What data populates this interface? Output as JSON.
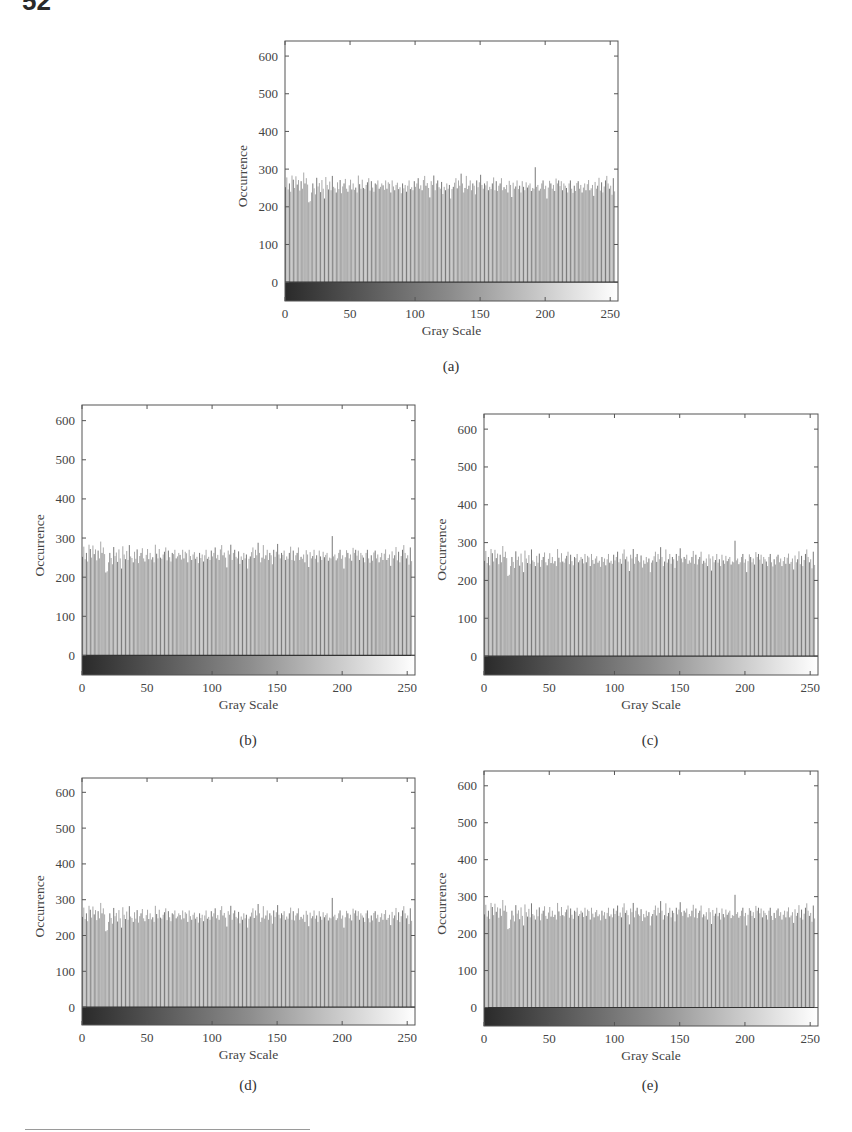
{
  "page": {
    "number": "52"
  },
  "chart_data": [
    {
      "id": "a",
      "type": "bar",
      "caption": "(a)",
      "title": "",
      "xlabel": "Gray Scale",
      "ylabel": "Occurrence",
      "xlim": [
        0,
        255
      ],
      "ylim": [
        -50,
        640
      ],
      "xticks": [
        0,
        50,
        100,
        150,
        200,
        250
      ],
      "yticks": [
        0,
        100,
        200,
        300,
        400,
        500,
        600
      ],
      "grid": false,
      "legend": null,
      "colorbar": "grayscale gradient black to white below zero line",
      "description": "Near-uniform histogram; 256 bins each roughly 210–290, mean ≈ 250, one spike ≈ 305 near gray level 197",
      "values_summary": {
        "min": 210,
        "max": 305,
        "mean": 250
      }
    },
    {
      "id": "b",
      "type": "bar",
      "caption": "(b)",
      "xlabel": "Gray Scale",
      "ylabel": "Occurrence",
      "xlim": [
        0,
        255
      ],
      "ylim": [
        -50,
        640
      ],
      "xticks": [
        0,
        50,
        100,
        150,
        200,
        250
      ],
      "yticks": [
        0,
        100,
        200,
        300,
        400,
        500,
        600
      ],
      "grid": false,
      "legend": null,
      "description": "Near-uniform histogram; bins roughly 210–290, spike ≈ 305 near gray level 197",
      "values_summary": {
        "min": 210,
        "max": 305,
        "mean": 250
      }
    },
    {
      "id": "c",
      "type": "bar",
      "caption": "(c)",
      "xlabel": "Gray Scale",
      "ylabel": "Occurrence",
      "xlim": [
        0,
        255
      ],
      "ylim": [
        -50,
        640
      ],
      "xticks": [
        0,
        50,
        100,
        150,
        200,
        250
      ],
      "yticks": [
        0,
        100,
        200,
        300,
        400,
        500,
        600
      ],
      "grid": false,
      "legend": null,
      "description": "Near-uniform histogram; bins roughly 210–290, spike ≈ 305 near gray level 197",
      "values_summary": {
        "min": 210,
        "max": 305,
        "mean": 250
      }
    },
    {
      "id": "d",
      "type": "bar",
      "caption": "(d)",
      "xlabel": "Gray Scale",
      "ylabel": "Occurrence",
      "xlim": [
        0,
        255
      ],
      "ylim": [
        -50,
        640
      ],
      "xticks": [
        0,
        50,
        100,
        150,
        200,
        250
      ],
      "yticks": [
        0,
        100,
        200,
        300,
        400,
        500,
        600
      ],
      "grid": false,
      "legend": null,
      "description": "Near-uniform histogram; bins roughly 210–290, spike ≈ 305 near gray level 197",
      "values_summary": {
        "min": 210,
        "max": 305,
        "mean": 250
      }
    },
    {
      "id": "e",
      "type": "bar",
      "caption": "(e)",
      "xlabel": "Gray Scale",
      "ylabel": "Occurrence",
      "xlim": [
        0,
        255
      ],
      "ylim": [
        -50,
        640
      ],
      "xticks": [
        0,
        50,
        100,
        150,
        200,
        250
      ],
      "yticks": [
        0,
        100,
        200,
        300,
        400,
        500,
        600
      ],
      "grid": false,
      "legend": null,
      "description": "Near-uniform histogram; bins roughly 210–290, spike ≈ 305 near gray level 197",
      "values_summary": {
        "min": 210,
        "max": 305,
        "mean": 250
      }
    }
  ],
  "histogram_values": [
    252,
    278,
    246,
    262,
    240,
    283,
    272,
    250,
    281,
    259,
    271,
    243,
    268,
    248,
    291,
    262,
    276,
    259,
    212,
    215,
    238,
    262,
    249,
    233,
    277,
    254,
    263,
    239,
    271,
    248,
    222,
    279,
    258,
    246,
    267,
    244,
    282,
    253,
    249,
    238,
    265,
    247,
    271,
    236,
    254,
    262,
    274,
    248,
    240,
    257,
    272,
    246,
    262,
    245,
    251,
    238,
    283,
    260,
    248,
    272,
    250,
    247,
    258,
    265,
    276,
    243,
    268,
    251,
    240,
    262,
    259,
    270,
    248,
    253,
    262,
    257,
    245,
    270,
    248,
    265,
    261,
    238,
    270,
    254,
    244,
    258,
    264,
    247,
    252,
    236,
    262,
    249,
    258,
    240,
    256,
    270,
    247,
    252,
    244,
    268,
    253,
    262,
    276,
    248,
    257,
    244,
    271,
    282,
    256,
    263,
    250,
    225,
    268,
    258,
    283,
    244,
    262,
    270,
    252,
    248,
    266,
    234,
    253,
    244,
    262,
    248,
    258,
    222,
    247,
    253,
    264,
    276,
    249,
    270,
    256,
    288,
    262,
    238,
    250,
    282,
    247,
    256,
    270,
    244,
    262,
    256,
    233,
    270,
    252,
    265,
    285,
    258,
    248,
    262,
    257,
    268,
    244,
    253,
    247,
    262,
    278,
    244,
    268,
    242,
    256,
    262,
    276,
    244,
    252,
    247,
    258,
    238,
    269,
    258,
    226,
    264,
    248,
    254,
    270,
    247,
    256,
    238,
    268,
    253,
    244,
    265,
    251,
    257,
    262,
    242,
    250,
    248,
    305,
    253,
    258,
    243,
    248,
    262,
    270,
    247,
    256,
    222,
    251,
    269,
    262,
    248,
    258,
    242,
    275,
    262,
    270,
    255,
    268,
    244,
    262,
    256,
    250,
    238,
    262,
    270,
    248,
    237,
    256,
    242,
    263,
    268,
    248,
    258,
    238,
    251,
    262,
    244,
    260,
    271,
    244,
    249,
    258,
    229,
    266,
    248,
    256,
    277,
    243,
    265,
    238,
    254,
    270,
    282,
    262,
    248,
    256,
    232,
    276,
    241
  ]
}
